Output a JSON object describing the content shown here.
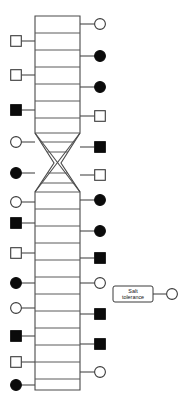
{
  "diagram": {
    "kind": "genetic-linkage-map",
    "title": "",
    "canvas": {
      "width": 185,
      "height": 406
    },
    "chromosome": {
      "name": "chromosome-bar",
      "left_x": 35,
      "right_x": 80,
      "top_y": 16,
      "bottom_y": 390,
      "waist_y": 163,
      "upper_taper_start_y": 133,
      "lower_taper_end_y": 192,
      "waist_left_x": 54,
      "waist_right_x": 61,
      "stroke_color": "#4a4a4a",
      "fill_color": "#ffffff"
    },
    "rungs_y": [
      33,
      50,
      67,
      84,
      101,
      118,
      133,
      192,
      209,
      226,
      243,
      260,
      277,
      294,
      311,
      328,
      345,
      362,
      379
    ],
    "crossover": {
      "name": "crossover-region",
      "label": "",
      "top_y": 133,
      "bottom_y": 192,
      "mid_y": 163
    },
    "symbol_legend": {
      "open_circle": "unaffected-female",
      "filled_circle": "affected-female",
      "open_square": "unaffected-male",
      "filled_square": "affected-male"
    },
    "colors": {
      "filled": "#0b0b0b",
      "open_fill": "#ffffff",
      "stroke": "#3a3a3a",
      "line": "#4a4a4a",
      "background": "#ffffff"
    },
    "left_markers": [
      {
        "id": "L1",
        "shape": "square",
        "state": "open",
        "y": 41,
        "cx": 16
      },
      {
        "id": "L2",
        "shape": "square",
        "state": "open",
        "y": 75,
        "cx": 16
      },
      {
        "id": "L3",
        "shape": "square",
        "state": "filled",
        "y": 110,
        "cx": 16
      },
      {
        "id": "L4",
        "shape": "circle",
        "state": "open",
        "y": 142,
        "cx": 16
      },
      {
        "id": "L5",
        "shape": "circle",
        "state": "filled",
        "y": 173,
        "cx": 16
      },
      {
        "id": "L6",
        "shape": "circle",
        "state": "open",
        "y": 202,
        "cx": 16
      },
      {
        "id": "L7",
        "shape": "square",
        "state": "filled",
        "y": 223,
        "cx": 16
      },
      {
        "id": "L8",
        "shape": "square",
        "state": "open",
        "y": 253,
        "cx": 16
      },
      {
        "id": "L9",
        "shape": "circle",
        "state": "filled",
        "y": 283,
        "cx": 16
      },
      {
        "id": "L10",
        "shape": "circle",
        "state": "open",
        "y": 308,
        "cx": 16
      },
      {
        "id": "L11",
        "shape": "square",
        "state": "filled",
        "y": 336,
        "cx": 16
      },
      {
        "id": "L12",
        "shape": "square",
        "state": "open",
        "y": 362,
        "cx": 16
      },
      {
        "id": "L13",
        "shape": "circle",
        "state": "filled",
        "y": 385,
        "cx": 16
      }
    ],
    "right_markers": [
      {
        "id": "R1",
        "shape": "circle",
        "state": "open",
        "y": 24,
        "cx": 100
      },
      {
        "id": "R2",
        "shape": "circle",
        "state": "filled",
        "y": 56,
        "cx": 100
      },
      {
        "id": "R3",
        "shape": "circle",
        "state": "filled",
        "y": 87,
        "cx": 100
      },
      {
        "id": "R4",
        "shape": "square",
        "state": "open",
        "y": 116,
        "cx": 100
      },
      {
        "id": "R5",
        "shape": "square",
        "state": "filled",
        "y": 147,
        "cx": 100
      },
      {
        "id": "R6",
        "shape": "square",
        "state": "open",
        "y": 175,
        "cx": 100
      },
      {
        "id": "R7",
        "shape": "circle",
        "state": "filled",
        "y": 200,
        "cx": 100
      },
      {
        "id": "R8",
        "shape": "circle",
        "state": "filled",
        "y": 231,
        "cx": 100
      },
      {
        "id": "R9",
        "shape": "square",
        "state": "filled",
        "y": 258,
        "cx": 100
      },
      {
        "id": "R10",
        "shape": "circle",
        "state": "open",
        "y": 283,
        "cx": 100
      },
      {
        "id": "R11",
        "shape": "square",
        "state": "filled",
        "y": 314,
        "cx": 100
      },
      {
        "id": "R12",
        "shape": "square",
        "state": "filled",
        "y": 344,
        "cx": 100
      },
      {
        "id": "R13",
        "shape": "circle",
        "state": "open",
        "y": 372,
        "cx": 100
      }
    ],
    "trait": {
      "name": "salt-tolerance-locus",
      "label_line1": "Salt",
      "label_line2": "tolerance",
      "label_full": "Salt tolerance",
      "box": {
        "x": 113,
        "y": 286,
        "width": 40,
        "height": 16,
        "rx": 2
      },
      "connector_from_x": 153,
      "connector_to_x": 166,
      "connector_y": 294,
      "terminal_symbol": {
        "shape": "circle",
        "state": "open",
        "cx": 172,
        "cy": 294
      }
    }
  }
}
